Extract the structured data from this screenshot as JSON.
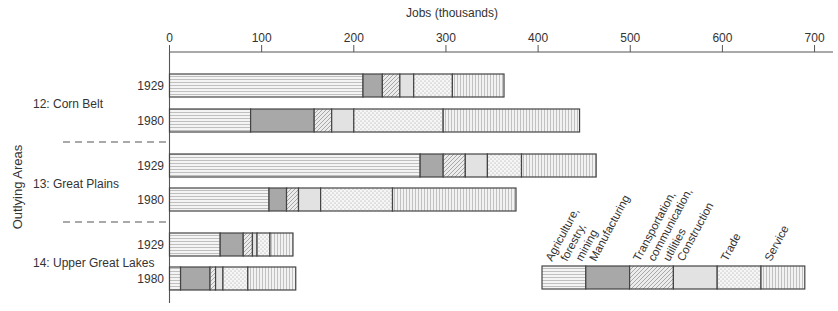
{
  "chart_data": {
    "type": "bar",
    "orientation": "horizontal-stacked",
    "title": "Jobs (thousands)",
    "xlabel": "Jobs (thousands)",
    "ylabel": "Outlying Areas",
    "xlim": [
      0,
      720
    ],
    "xticks": [
      0,
      100,
      200,
      300,
      400,
      500,
      600,
      700
    ],
    "categories_legend": [
      "Agriculture, forestry, mining",
      "Manufacturing",
      "Transportation, communication, utilities",
      "Construction",
      "Trade",
      "Service"
    ],
    "groups": [
      {
        "name": "12: Corn Belt",
        "rows": [
          {
            "year": "1929",
            "values": [
              210,
              21,
              19,
              15,
              42,
              56
            ]
          },
          {
            "year": "1980",
            "values": [
              88,
              69,
              19,
              24,
              97,
              148
            ]
          }
        ]
      },
      {
        "name": "13: Great Plains",
        "rows": [
          {
            "year": "1929",
            "values": [
              272,
              25,
              24,
              24,
              37,
              81
            ]
          },
          {
            "year": "1980",
            "values": [
              108,
              19,
              13,
              24,
              78,
              134
            ]
          }
        ]
      },
      {
        "name": "14: Upper Great Lakes",
        "rows": [
          {
            "year": "1929",
            "values": [
              55,
              25,
              10,
              5,
              14,
              25
            ]
          },
          {
            "year": "1980",
            "values": [
              12,
              32,
              6,
              8,
              27,
              52
            ]
          }
        ]
      }
    ],
    "grid": false,
    "legend_position": "bottom-right"
  },
  "labels": {
    "title": "Jobs (thousands)",
    "ylabel": "Outlying Areas",
    "legend": [
      "Agriculture,|forestry,|mining",
      "Manufacturing",
      "Transportation,|communication,|utilities",
      "Construction",
      "Trade",
      "Service"
    ]
  },
  "colors": {
    "agriculture": "#f2f2f2",
    "manufacturing": "#a8a8a8",
    "transportation": "#e8e8e8",
    "construction": "#e2e2e2",
    "trade": "#f4f4f4",
    "service": "#eeeeee",
    "border": "#444444"
  }
}
